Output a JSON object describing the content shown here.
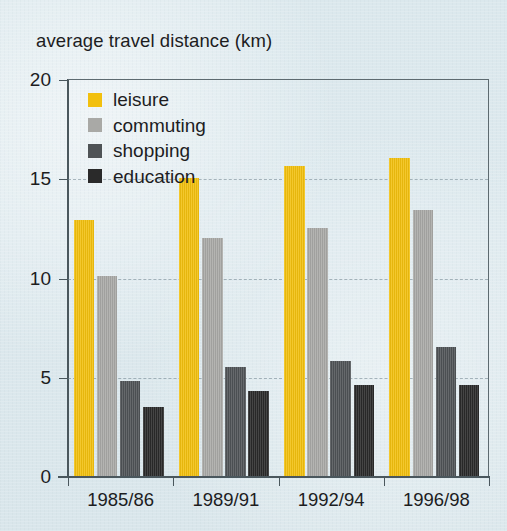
{
  "chart_data": {
    "type": "bar",
    "title": "average travel distance (km)",
    "xlabel": "",
    "ylabel": "average travel distance (km)",
    "categories": [
      "1985/86",
      "1989/91",
      "1992/94",
      "1996/98"
    ],
    "series": [
      {
        "name": "leisure",
        "color": "#f2c00e",
        "values": [
          12.9,
          15.0,
          15.6,
          16.0
        ]
      },
      {
        "name": "commuting",
        "color": "#a9a9a6",
        "values": [
          10.1,
          12.0,
          12.5,
          13.4
        ]
      },
      {
        "name": "shopping",
        "color": "#4f5356",
        "values": [
          4.8,
          5.5,
          5.8,
          6.5
        ]
      },
      {
        "name": "education",
        "color": "#2a2a2a",
        "values": [
          3.5,
          4.3,
          4.6,
          4.6
        ]
      }
    ],
    "ylim": [
      0,
      20
    ],
    "yticks": [
      0,
      5,
      10,
      15,
      20
    ],
    "ytick_labels": [
      "0",
      "5",
      "10",
      "15",
      "20"
    ],
    "grid": true,
    "grid_axis": "y",
    "legend_position": "top-left",
    "background_color": "#dce9ed",
    "axis_color": "#4a575d"
  },
  "legend": {
    "items": [
      {
        "label": "leisure"
      },
      {
        "label": "commuting"
      },
      {
        "label": "shopping"
      },
      {
        "label": "education"
      }
    ]
  }
}
